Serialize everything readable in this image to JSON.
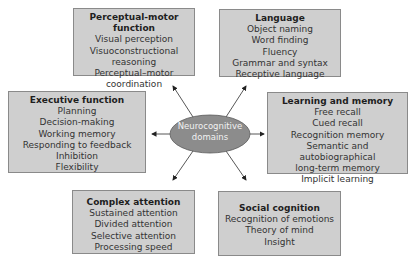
{
  "diagram": {
    "center": {
      "label_line1": "Neurocognitive",
      "label_line2": "domains",
      "fill": "#8c8c8c"
    },
    "box_fill": "#cfcfcf",
    "domains": [
      {
        "id": "perceptual-motor",
        "title": "Perceptual-motor function",
        "items": [
          "Visual perception",
          "Visuoconstructional",
          "reasoning",
          "Perceptual–motor",
          "coordination"
        ]
      },
      {
        "id": "language",
        "title": "Language",
        "items": [
          "Object naming",
          "Word finding",
          "Fluency",
          "Grammar and syntax",
          "Receptive language"
        ]
      },
      {
        "id": "executive",
        "title": "Executive function",
        "items": [
          "Planning",
          "Decision-making",
          "Working memory",
          "Responding to feedback",
          "Inhibition",
          "Flexibility"
        ]
      },
      {
        "id": "learning-memory",
        "title": "Learning and memory",
        "items": [
          "Free recall",
          "Cued recall",
          "Recognition memory",
          "Semantic and autobiographical",
          "long-term memory",
          "Implicit learning"
        ]
      },
      {
        "id": "complex-attention",
        "title": "Complex attention",
        "items": [
          "Sustained attention",
          "Divided attention",
          "Selective attention",
          "Processing speed"
        ]
      },
      {
        "id": "social-cognition",
        "title": "Social cognition",
        "items": [
          "Recognition of emotions",
          "Theory of mind",
          "Insight"
        ]
      }
    ]
  }
}
